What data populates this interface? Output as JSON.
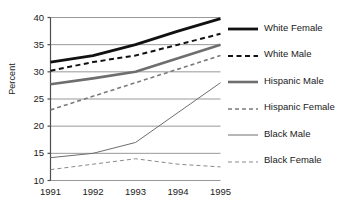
{
  "chart_data": {
    "type": "line",
    "title": "",
    "xlabel": "",
    "ylabel": "Percent",
    "categories": [
      "1991",
      "1992",
      "1993",
      "1994",
      "1995"
    ],
    "x": [
      1991,
      1992,
      1993,
      1994,
      1995
    ],
    "ylim": [
      10,
      40
    ],
    "yticks": [
      "10",
      "15",
      "20",
      "25",
      "30",
      "35",
      "40"
    ],
    "ytick_values": [
      10,
      15,
      20,
      25,
      30,
      35,
      40
    ],
    "grid": "horizontal",
    "legend_position": "right",
    "series": [
      {
        "name": "White Female",
        "values": [
          31.8,
          33.0,
          35.0,
          37.5,
          39.8
        ],
        "color": "#111111",
        "style": "solid",
        "width": 2.8
      },
      {
        "name": "White Male",
        "values": [
          30.2,
          31.8,
          33.0,
          35.0,
          37.0
        ],
        "color": "#111111",
        "style": "dashed",
        "width": 2.0
      },
      {
        "name": "Hispanic Male",
        "values": [
          27.7,
          28.8,
          30.0,
          32.5,
          35.0
        ],
        "color": "#6e6e6e",
        "style": "solid",
        "width": 2.6
      },
      {
        "name": "Hispanic Female",
        "values": [
          23.0,
          25.5,
          28.0,
          30.5,
          33.0
        ],
        "color": "#7a7a7a",
        "style": "dashed",
        "width": 1.6
      },
      {
        "name": "Black Male",
        "values": [
          14.2,
          15.0,
          17.0,
          22.5,
          28.0
        ],
        "color": "#6e6e6e",
        "style": "solid",
        "width": 1.0
      },
      {
        "name": "Black Female",
        "values": [
          12.0,
          13.0,
          14.0,
          13.0,
          12.5
        ],
        "color": "#8a8a8a",
        "style": "dashed",
        "width": 1.0
      }
    ]
  },
  "legend": {
    "items": [
      {
        "label": "White Female"
      },
      {
        "label": "White Male"
      },
      {
        "label": "Hispanic Male"
      },
      {
        "label": "Hispanic Female"
      },
      {
        "label": "Black Male"
      },
      {
        "label": "Black Female"
      }
    ]
  },
  "axes": {
    "y_axis_title": "Percent"
  }
}
